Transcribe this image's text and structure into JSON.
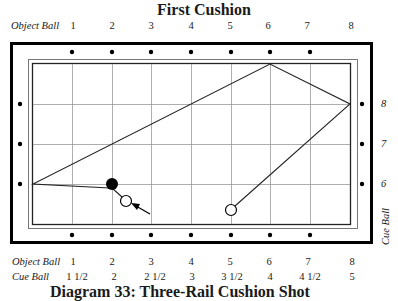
{
  "title": "First Cushion",
  "caption_partial": "Diagram 33: Three-Rail Cushion Shot",
  "top_axis": {
    "label": "Object Ball",
    "ticks": [
      "1",
      "2",
      "3",
      "4",
      "5",
      "6",
      "7",
      "8"
    ]
  },
  "right_axis": {
    "label": "Cue Ball",
    "ticks": [
      "8",
      "7",
      "6"
    ]
  },
  "bottom_table": {
    "rows": [
      {
        "label": "Object Ball",
        "values": [
          "1",
          "2",
          "3",
          "4",
          "5",
          "6",
          "7",
          "8"
        ]
      },
      {
        "label": "Cue Ball",
        "values": [
          "1 1/2",
          "2",
          "2 1/2",
          "3",
          "3 1/2",
          "4",
          "4 1/2",
          "5"
        ]
      }
    ]
  },
  "diagram": {
    "object_ball": {
      "color": "#000000",
      "cx": 112,
      "cy": 184
    },
    "cue_ball_start": {
      "color": "#ffffff",
      "cx": 126,
      "cy": 201
    },
    "cue_ball_end": {
      "color": "#ffffff",
      "cx": 231,
      "cy": 210
    },
    "path_points": [
      [
        110,
        188
      ],
      [
        33,
        184
      ],
      [
        270,
        64
      ],
      [
        350,
        104
      ],
      [
        235,
        206
      ]
    ]
  }
}
